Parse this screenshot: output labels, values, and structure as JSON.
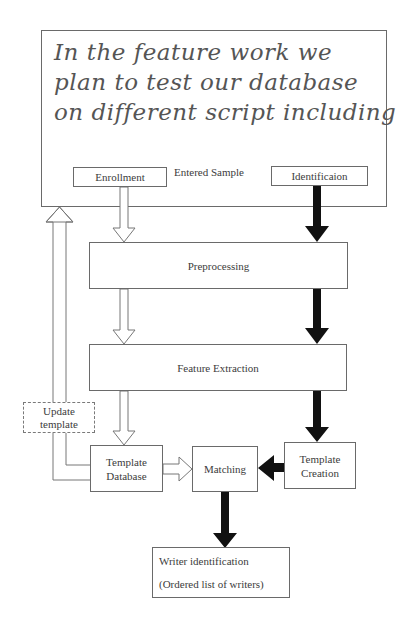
{
  "handwriting": {
    "lines": [
      "In the feature work we",
      "plan to test our database",
      "on different script including"
    ]
  },
  "diagram": {
    "entered_sample_label": "Entered Sample",
    "nodes": {
      "enrollment": "Enrollment",
      "identification": "Identificaion",
      "preprocessing": "Preprocessing",
      "feature_extraction": "Feature Extraction",
      "update_template": [
        "Update",
        "template"
      ],
      "template_database": [
        "Template",
        "Database"
      ],
      "matching": "Matching",
      "template_creation": [
        "Template",
        "Creation"
      ],
      "writer_identification": [
        "Writer identification",
        "(Ordered list of writers)"
      ]
    },
    "edges": [
      {
        "from": "Enrollment",
        "to": "Preprocessing",
        "style": "hollow"
      },
      {
        "from": "Preprocessing",
        "to": "Feature Extraction",
        "style": "hollow"
      },
      {
        "from": "Feature Extraction",
        "to": "Template Database",
        "style": "hollow"
      },
      {
        "from": "Template Database",
        "to": "Matching",
        "style": "hollow"
      },
      {
        "from": "Template Database",
        "to": "Entered Sample",
        "style": "hollow",
        "via": "Update template"
      },
      {
        "from": "Identificaion",
        "to": "Preprocessing",
        "style": "solid"
      },
      {
        "from": "Preprocessing",
        "to": "Feature Extraction",
        "style": "solid"
      },
      {
        "from": "Feature Extraction",
        "to": "Template Creation",
        "style": "solid"
      },
      {
        "from": "Template Creation",
        "to": "Matching",
        "style": "solid"
      },
      {
        "from": "Matching",
        "to": "Writer identification",
        "style": "solid"
      }
    ],
    "colors": {
      "border": "#6a6a6a",
      "solid_arrow": "#111111",
      "hollow_arrow_stroke": "#777777",
      "text": "#3c3c3c"
    }
  }
}
